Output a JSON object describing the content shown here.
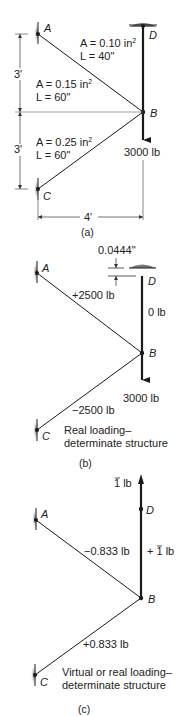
{
  "figure": {
    "panels": [
      {
        "id": "a",
        "caption": "(a)",
        "nodes": {
          "A": "A",
          "B": "B",
          "C": "C",
          "D": "D"
        },
        "members": [
          {
            "name": "BD",
            "area": "A = 0.10 in",
            "area_exp": "2",
            "length": "L = 40\""
          },
          {
            "name": "AB",
            "area": "A = 0.15 in",
            "area_exp": "2",
            "length": "L = 60\""
          },
          {
            "name": "BC",
            "area": "A = 0.25 in",
            "area_exp": "2",
            "length": "L = 60\""
          }
        ],
        "load": "3000 lb",
        "dims": {
          "upper": "3'",
          "lower": "3'",
          "horizontal": "4'"
        }
      },
      {
        "id": "b",
        "caption": "(b)",
        "nodes": {
          "A": "A",
          "B": "B",
          "C": "C",
          "D": "D"
        },
        "gap": "0.0444\"",
        "forces": {
          "AB": "+2500 lb",
          "BD": "0 lb",
          "BC": "−2500 lb"
        },
        "load": "3000 lb",
        "note_line1": "Real loading–",
        "note_line2": "determinate structure"
      },
      {
        "id": "c",
        "caption": "(c)",
        "nodes": {
          "A": "A",
          "B": "B",
          "C": "C",
          "D": "D"
        },
        "unit_load": "1 lb",
        "unit_bar": "¯",
        "forces": {
          "AB": "−0.833 lb",
          "BD": "+ 1 lb",
          "BC": "+0.833 lb"
        },
        "note_line1": "Virtual or real loading–",
        "note_line2": "determinate structure"
      }
    ],
    "colors": {
      "line": "#1a1a1a",
      "thin_line": "#333333",
      "support_shadow": "#888888"
    }
  }
}
